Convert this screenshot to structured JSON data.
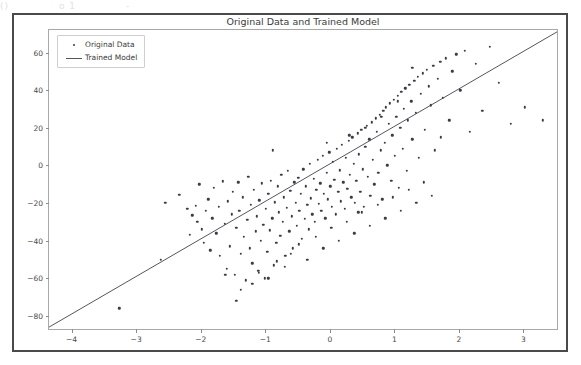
{
  "artifacts": {
    "top_row": [
      "()",
      "o 1",
      "-"
    ]
  },
  "chart_data": {
    "type": "scatter",
    "title": "Original Data and Trained Model",
    "xlabel": "",
    "ylabel": "",
    "legend": [
      "Original Data",
      "Trained Model"
    ],
    "legend_position": "upper left",
    "grid": false,
    "xlim": [
      -4.35,
      3.55
    ],
    "ylim": [
      -88,
      72
    ],
    "xticks": [
      -4,
      -3,
      -2,
      -1,
      0,
      1,
      2,
      3
    ],
    "yticks": [
      -80,
      -60,
      -40,
      -20,
      0,
      20,
      40,
      60
    ],
    "marker_color": "#3c3c48",
    "line_color": "#55555f",
    "fit_line": {
      "slope": 20.0,
      "intercept": 0.0,
      "x_endpoints": [
        -4.35,
        3.55
      ],
      "y_endpoints": [
        -87.0,
        71.0
      ]
    },
    "series": [
      {
        "name": "Original Data",
        "x": [
          -3.26,
          -2.62,
          -2.55,
          -2.33,
          -2.21,
          -2.17,
          -2.13,
          -2.08,
          -2.05,
          -2.02,
          -1.98,
          -1.95,
          -1.92,
          -1.88,
          -1.85,
          -1.82,
          -1.8,
          -1.76,
          -1.72,
          -1.7,
          -1.66,
          -1.63,
          -1.6,
          -1.58,
          -1.55,
          -1.52,
          -1.5,
          -1.47,
          -1.45,
          -1.42,
          -1.4,
          -1.38,
          -1.35,
          -1.33,
          -1.3,
          -1.28,
          -1.26,
          -1.24,
          -1.22,
          -1.2,
          -1.18,
          -1.15,
          -1.13,
          -1.11,
          -1.09,
          -1.07,
          -1.05,
          -1.03,
          -1.01,
          -0.99,
          -0.97,
          -0.95,
          -0.93,
          -0.91,
          -0.89,
          -0.87,
          -0.85,
          -0.83,
          -0.81,
          -0.79,
          -0.77,
          -0.75,
          -0.73,
          -0.71,
          -0.69,
          -0.67,
          -0.65,
          -0.63,
          -0.61,
          -0.59,
          -0.57,
          -0.55,
          -0.53,
          -0.51,
          -0.49,
          -0.47,
          -0.45,
          -0.43,
          -0.41,
          -0.39,
          -0.37,
          -0.35,
          -0.33,
          -0.31,
          -0.29,
          -0.27,
          -0.25,
          -0.23,
          -0.21,
          -0.19,
          -0.17,
          -0.15,
          -0.13,
          -0.11,
          -0.09,
          -0.07,
          -0.05,
          -0.03,
          -0.01,
          0.01,
          0.03,
          0.05,
          0.07,
          0.09,
          0.11,
          0.13,
          0.15,
          0.17,
          0.19,
          0.21,
          0.23,
          0.25,
          0.27,
          0.29,
          0.31,
          0.33,
          0.35,
          0.37,
          0.39,
          0.41,
          0.43,
          0.45,
          0.47,
          0.49,
          0.51,
          0.53,
          0.55,
          0.57,
          0.59,
          0.61,
          0.63,
          0.65,
          0.67,
          0.69,
          0.71,
          0.73,
          0.75,
          0.77,
          0.79,
          0.81,
          0.83,
          0.85,
          0.87,
          0.89,
          0.91,
          0.93,
          0.95,
          0.97,
          0.99,
          1.01,
          1.03,
          1.05,
          1.07,
          1.09,
          1.11,
          1.13,
          1.15,
          1.17,
          1.19,
          1.21,
          1.23,
          1.26,
          1.28,
          1.31,
          1.33,
          1.36,
          1.38,
          1.41,
          1.44,
          1.47,
          1.5,
          1.53,
          1.56,
          1.6,
          1.63,
          1.67,
          1.71,
          1.75,
          1.8,
          1.85,
          1.9,
          1.96,
          2.02,
          2.09,
          2.17,
          2.26,
          2.36,
          2.48,
          2.62,
          2.8,
          3.02,
          3.3,
          -1.45,
          -1.38,
          -1.2,
          -1.1,
          -0.95,
          -0.82,
          -0.7,
          -0.6,
          -0.48,
          -0.35,
          -0.22,
          -0.1,
          0.02,
          0.14,
          0.26,
          0.38,
          0.5,
          0.62,
          0.74,
          0.86,
          0.98,
          1.1,
          1.22,
          1.34,
          1.46,
          1.58,
          -0.05,
          0.3,
          0.55,
          0.8,
          1.05,
          -1.62,
          -0.88,
          0.44,
          1.28,
          1.72
        ],
        "y": [
          -76.0,
          -50.0,
          -20.0,
          -15.5,
          -23.0,
          -37.0,
          -26.5,
          -21.5,
          -30.0,
          -10.0,
          -34.0,
          -41.0,
          -24.0,
          -18.0,
          -45.0,
          -28.0,
          -12.0,
          -36.0,
          -22.0,
          -48.0,
          -8.5,
          -31.0,
          -55.0,
          -19.0,
          -43.0,
          -26.0,
          -14.0,
          -58.0,
          -33.0,
          -9.0,
          -24.0,
          -47.0,
          -17.0,
          -38.0,
          -61.0,
          -29.0,
          -6.0,
          -44.0,
          -21.0,
          -52.0,
          -13.0,
          -35.0,
          -27.0,
          -56.0,
          -18.5,
          -40.0,
          -9.5,
          -31.5,
          -60.0,
          -23.0,
          -46.0,
          -15.0,
          -34.5,
          -8.0,
          -28.0,
          -53.0,
          -19.5,
          -41.0,
          -11.0,
          -25.0,
          -37.5,
          -5.0,
          -30.0,
          -17.0,
          -48.0,
          -22.5,
          -3.0,
          -35.0,
          -13.5,
          -27.0,
          -44.0,
          -9.0,
          -20.0,
          -32.0,
          -6.5,
          -24.0,
          -15.0,
          -39.0,
          -2.0,
          -28.5,
          -11.0,
          -21.0,
          -34.0,
          1.0,
          -17.5,
          -26.0,
          -7.0,
          -30.0,
          -13.0,
          3.0,
          -20.5,
          -9.5,
          -24.0,
          5.0,
          -15.0,
          -28.0,
          -4.0,
          -18.0,
          7.0,
          -11.0,
          -22.0,
          2.0,
          -7.5,
          -26.0,
          9.0,
          -14.0,
          -2.5,
          -19.0,
          11.0,
          -9.0,
          -23.0,
          4.0,
          -12.5,
          13.0,
          -5.0,
          -17.0,
          15.0,
          1.0,
          -20.0,
          -8.0,
          17.0,
          6.0,
          -14.0,
          19.0,
          -2.0,
          -22.0,
          10.0,
          21.0,
          -6.0,
          14.0,
          -16.0,
          23.0,
          3.0,
          -10.0,
          25.0,
          18.0,
          -4.0,
          27.0,
          8.0,
          -18.0,
          29.0,
          12.0,
          31.0,
          0.0,
          22.0,
          33.0,
          -8.0,
          16.0,
          35.0,
          5.0,
          26.0,
          37.0,
          -12.0,
          20.0,
          39.0,
          9.0,
          30.0,
          41.0,
          -3.0,
          24.0,
          43.0,
          34.0,
          14.0,
          45.0,
          28.0,
          47.0,
          4.0,
          38.0,
          49.0,
          19.0,
          51.0,
          42.0,
          32.0,
          53.0,
          8.0,
          46.0,
          55.0,
          36.0,
          57.0,
          24.0,
          50.0,
          59.0,
          40.0,
          61.0,
          18.0,
          54.0,
          29.0,
          63.0,
          44.0,
          22.0,
          31.0,
          24.0,
          -72.0,
          -66.0,
          -63.0,
          -57.0,
          -60.0,
          -51.0,
          -54.0,
          -47.0,
          -42.0,
          -50.0,
          -38.0,
          -44.0,
          -33.0,
          -40.0,
          -30.0,
          -36.0,
          -25.0,
          -32.0,
          -21.0,
          -28.0,
          -17.0,
          -24.0,
          -13.0,
          -20.0,
          -9.0,
          -16.0,
          12.0,
          16.0,
          20.0,
          26.0,
          34.0,
          -58.0,
          8.0,
          -25.0,
          52.0,
          15.0
        ]
      }
    ]
  }
}
